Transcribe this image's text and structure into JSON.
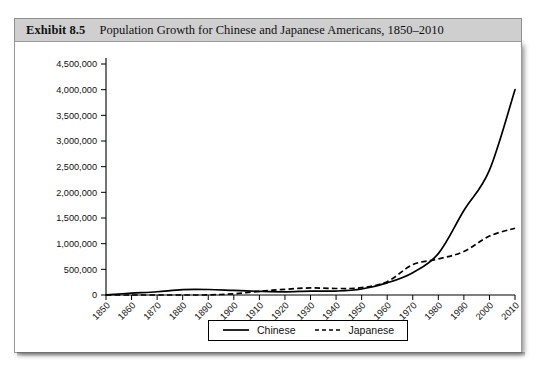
{
  "figure": {
    "exhibit_label": "Exhibit 8.5",
    "title": "Population Growth for Chinese and Japanese Americans, 1850–2010"
  },
  "legend": {
    "position": "bottom-center",
    "entries": [
      {
        "label": "Chinese",
        "style": "solid",
        "icon": "solid-line-icon"
      },
      {
        "label": "Japanese",
        "style": "dashed",
        "icon": "dashed-line-icon"
      }
    ]
  },
  "colors": {
    "title_band": "#cfcfcf",
    "frame": "#9a9a9a",
    "series": "#000000",
    "text": "#111111"
  },
  "chart_data": {
    "type": "line",
    "title": "Population Growth for Chinese and Japanese Americans, 1850–2010",
    "xlabel": "",
    "ylabel": "",
    "grid": false,
    "legend_position": "bottom-center",
    "xlim": [
      1850,
      2010
    ],
    "ylim": [
      0,
      4500000
    ],
    "ytick_step": 500000,
    "x": [
      1850,
      1860,
      1870,
      1880,
      1890,
      1900,
      1910,
      1920,
      1930,
      1940,
      1950,
      1960,
      1970,
      1980,
      1990,
      2000,
      2010
    ],
    "categories": [
      "1850",
      "1860",
      "1870",
      "1880",
      "1890",
      "1900",
      "1910",
      "1920",
      "1930",
      "1940",
      "1950",
      "1960",
      "1970",
      "1980",
      "1990",
      "2000",
      "2010"
    ],
    "ytick_labels": [
      "0",
      "500,000",
      "1,000,000",
      "1,500,000",
      "2,000,000",
      "2,500,000",
      "3,000,000",
      "3,500,000",
      "4,000,000",
      "4,500,000"
    ],
    "ytick_values": [
      0,
      500000,
      1000000,
      1500000,
      2000000,
      2500000,
      3000000,
      3500000,
      4000000,
      4500000
    ],
    "series": [
      {
        "name": "Chinese",
        "style": "solid",
        "values": [
          4000,
          35000,
          63000,
          105000,
          107000,
          89000,
          71000,
          62000,
          75000,
          77000,
          117000,
          237000,
          435000,
          806000,
          1645000,
          2432000,
          4000000
        ]
      },
      {
        "name": "Japanese",
        "style": "dashed",
        "values": [
          0,
          0,
          0,
          150,
          2000,
          24000,
          72000,
          111000,
          138000,
          127000,
          142000,
          260000,
          591000,
          701000,
          848000,
          1148000,
          1300000
        ]
      }
    ]
  }
}
